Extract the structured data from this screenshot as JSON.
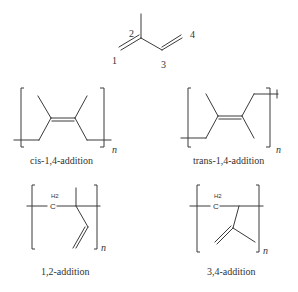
{
  "monomer": {
    "name": "isoprene",
    "locants": [
      "1",
      "2",
      "3",
      "4"
    ]
  },
  "structures": [
    {
      "id": "cis-1,4",
      "caption": "cis-1,4-addition",
      "repeat": "n"
    },
    {
      "id": "trans-1,4",
      "caption": "trans-1,4-addition",
      "repeat": "n"
    },
    {
      "id": "1,2",
      "caption": "1,2-addition",
      "repeat": "n",
      "atom_label": "C",
      "atom_sub": "H2"
    },
    {
      "id": "3,4",
      "caption": "3,4-addition",
      "repeat": "n",
      "atom_label": "C",
      "atom_sub": "H2"
    }
  ],
  "colors": {
    "line": "#3a3a3a",
    "text": "#333333",
    "background": "#ffffff"
  }
}
